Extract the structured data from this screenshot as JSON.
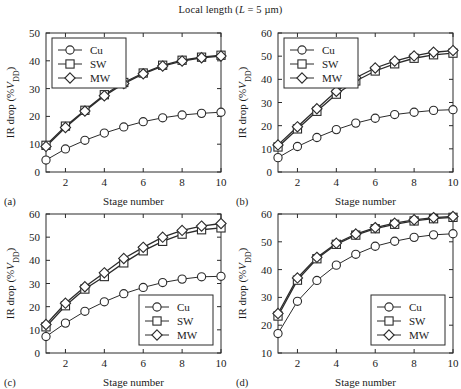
{
  "figure": {
    "title_prefix": "Local length (",
    "title_var": "L",
    "title_suffix": " = 5 µm)",
    "title_full": "Local length (L = 5 µm)",
    "background": "#ffffff",
    "ink_color": "#2b2b2b"
  },
  "common": {
    "xlabel": "Stage number",
    "ylabel_prefix": "IR drop (%",
    "ylabel_var": "V",
    "ylabel_sub": "DD",
    "ylabel_suffix": ")",
    "ylabel_full": "IR drop (%VDD)",
    "xticks": [
      2,
      4,
      6,
      8,
      10
    ],
    "xlim": [
      1,
      10
    ],
    "legend_entries": [
      {
        "label": "Cu",
        "marker": "circle"
      },
      {
        "label": "SW",
        "marker": "square"
      },
      {
        "label": "MW",
        "marker": "diamond"
      }
    ]
  },
  "chart_data": [
    {
      "type": "line",
      "panel": "(a)",
      "title": "Local length (L = 5 µm)",
      "xlabel": "Stage number",
      "ylabel": "IR drop (%VDD)",
      "x": [
        1,
        2,
        3,
        4,
        5,
        6,
        7,
        8,
        9,
        10
      ],
      "xlim": [
        1,
        10
      ],
      "ylim": [
        0,
        50
      ],
      "yticks": [
        0,
        10,
        20,
        30,
        40,
        50
      ],
      "xticks": [
        2,
        4,
        6,
        8,
        10
      ],
      "grid": false,
      "legend_position": "upper-left",
      "series": [
        {
          "name": "Cu",
          "marker": "circle",
          "values": [
            4.3,
            8.3,
            11.4,
            14.0,
            16.2,
            18.1,
            19.5,
            20.5,
            21.1,
            21.5
          ]
        },
        {
          "name": "SW",
          "marker": "square",
          "values": [
            9.6,
            16.5,
            22.2,
            27.8,
            32.2,
            35.6,
            38.4,
            40.2,
            41.3,
            42.0
          ]
        },
        {
          "name": "MW",
          "marker": "diamond",
          "values": [
            9.2,
            16.0,
            21.9,
            27.4,
            31.8,
            35.3,
            38.1,
            39.9,
            41.1,
            41.7
          ]
        }
      ]
    },
    {
      "type": "line",
      "panel": "(b)",
      "title": "Local length (L = 5 µm)",
      "xlabel": "Stage number",
      "ylabel": "IR drop (%VDD)",
      "x": [
        1,
        2,
        3,
        4,
        5,
        6,
        7,
        8,
        9,
        10
      ],
      "xlim": [
        1,
        10
      ],
      "ylim": [
        0,
        60
      ],
      "yticks": [
        0,
        10,
        20,
        30,
        40,
        50,
        60
      ],
      "xticks": [
        2,
        4,
        6,
        8,
        10
      ],
      "grid": false,
      "legend_position": "upper-left",
      "series": [
        {
          "name": "Cu",
          "marker": "circle",
          "values": [
            6.2,
            11.0,
            14.9,
            18.3,
            21.1,
            23.2,
            24.8,
            25.8,
            26.6,
            26.9
          ]
        },
        {
          "name": "SW",
          "marker": "square",
          "values": [
            10.8,
            18.6,
            26.2,
            33.6,
            39.3,
            43.6,
            46.7,
            49.1,
            50.6,
            51.3
          ]
        },
        {
          "name": "MW",
          "marker": "diamond",
          "values": [
            11.7,
            19.5,
            27.3,
            34.8,
            40.7,
            44.9,
            47.9,
            50.1,
            51.7,
            52.4
          ]
        }
      ]
    },
    {
      "type": "line",
      "panel": "(c)",
      "title": "Local length (L = 5 µm)",
      "xlabel": "Stage number",
      "ylabel": "IR drop (%VDD)",
      "x": [
        1,
        2,
        3,
        4,
        5,
        6,
        7,
        8,
        9,
        10
      ],
      "xlim": [
        1,
        10
      ],
      "ylim": [
        0,
        60
      ],
      "yticks": [
        0,
        10,
        20,
        30,
        40,
        50,
        60
      ],
      "xticks": [
        2,
        4,
        6,
        8,
        10
      ],
      "grid": false,
      "legend_position": "lower-right",
      "series": [
        {
          "name": "Cu",
          "marker": "circle",
          "values": [
            7.1,
            12.9,
            18.0,
            22.1,
            25.6,
            28.3,
            30.4,
            31.9,
            32.9,
            33.1
          ]
        },
        {
          "name": "SW",
          "marker": "square",
          "values": [
            11.3,
            20.4,
            27.6,
            33.0,
            38.9,
            44.1,
            48.2,
            51.3,
            53.2,
            54.0
          ]
        },
        {
          "name": "MW",
          "marker": "diamond",
          "values": [
            12.3,
            21.5,
            28.6,
            34.6,
            40.8,
            45.6,
            50.0,
            52.9,
            54.8,
            55.9
          ]
        }
      ]
    },
    {
      "type": "line",
      "panel": "(d)",
      "title": "Local length (L = 5 µm)",
      "xlabel": "Stage number",
      "ylabel": "IR drop (%VDD)",
      "x": [
        1,
        2,
        3,
        4,
        5,
        6,
        7,
        8,
        9,
        10
      ],
      "xlim": [
        1,
        10
      ],
      "ylim": [
        10,
        60
      ],
      "yticks": [
        10,
        20,
        30,
        40,
        50,
        60
      ],
      "xticks": [
        2,
        4,
        6,
        8,
        10
      ],
      "grid": false,
      "legend_position": "lower-right",
      "series": [
        {
          "name": "Cu",
          "marker": "circle",
          "values": [
            17.0,
            28.6,
            36.1,
            41.6,
            45.5,
            48.4,
            50.2,
            51.6,
            52.5,
            52.9
          ]
        },
        {
          "name": "SW",
          "marker": "square",
          "values": [
            23.3,
            36.2,
            43.9,
            49.1,
            52.4,
            54.7,
            56.3,
            57.5,
            58.3,
            58.8
          ]
        },
        {
          "name": "MW",
          "marker": "diamond",
          "values": [
            24.2,
            37.0,
            44.4,
            49.5,
            52.8,
            55.1,
            56.7,
            57.9,
            58.7,
            59.1
          ]
        }
      ]
    }
  ]
}
